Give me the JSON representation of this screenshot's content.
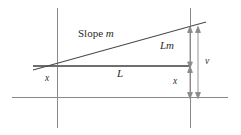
{
  "figure": {
    "background_color": "#ffffff",
    "line_color": "#808080",
    "text_color": "#2b2b2b",
    "width": 241,
    "height": 135
  },
  "labels": {
    "slope_prefix": "Slope",
    "slope_variable": "m",
    "rise": "Lm",
    "run": "L",
    "offset_left": "x",
    "offset_right": "x",
    "total": "v"
  },
  "geometry": {
    "axis_vertical_left": {
      "x": 57,
      "y1": 8,
      "y2": 128
    },
    "axis_vertical_right": {
      "x": 190,
      "y1": 8,
      "y2": 128
    },
    "baseline": {
      "y": 97,
      "x1": 12,
      "x2": 228
    },
    "run_line": {
      "y": 66,
      "x1": 33,
      "x2": 190
    },
    "slope_line": {
      "x1": 33,
      "y1": 70,
      "x2": 206,
      "y2": 22
    },
    "dimension_inner_x": 190,
    "dimension_outer_x": 198,
    "dimension_top_y": 28,
    "dimension_mid_y": 66,
    "dimension_bottom_y": 97
  }
}
